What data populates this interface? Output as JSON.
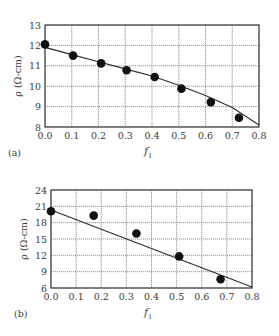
{
  "chart_data": [
    {
      "type": "scatter",
      "panel_label": "(a)",
      "title": "",
      "xlabel": "f",
      "xlabel_sub": "1",
      "ylabel": "ρ (Ω-cm)",
      "xlim": [
        0.0,
        0.8
      ],
      "ylim": [
        8,
        13
      ],
      "x_ticks": [
        "0.0",
        "0.1",
        "0.2",
        "0.3",
        "0.4",
        "0.5",
        "0.6",
        "0.7",
        "0.8"
      ],
      "y_ticks": [
        "8",
        "9",
        "10",
        "11",
        "12",
        "13"
      ],
      "grid": true,
      "legend": null,
      "frame": {
        "left": 45,
        "top": 25,
        "right": 259,
        "bottom": 127
      },
      "series": [
        {
          "name": "measured",
          "kind": "markers",
          "x": [
            0.0,
            0.105,
            0.21,
            0.305,
            0.41,
            0.51,
            0.62,
            0.725
          ],
          "y": [
            12.05,
            11.5,
            11.12,
            10.78,
            10.45,
            9.88,
            9.22,
            8.45
          ]
        },
        {
          "name": "fit",
          "kind": "line",
          "x": [
            0.0,
            0.1,
            0.2,
            0.3,
            0.4,
            0.5,
            0.6,
            0.7,
            0.8
          ],
          "y": [
            11.9,
            11.55,
            11.2,
            10.85,
            10.5,
            10.05,
            9.55,
            8.95,
            8.1
          ]
        }
      ]
    },
    {
      "type": "scatter",
      "panel_label": "(b)",
      "title": "",
      "xlabel": "f",
      "xlabel_sub": "1",
      "ylabel": "ρ (Ω-cm)",
      "xlim": [
        0.0,
        0.8
      ],
      "ylim": [
        6,
        24
      ],
      "x_ticks": [
        "0.0",
        "0.1",
        "0.2",
        "0.3",
        "0.4",
        "0.5",
        "0.6",
        "0.7",
        "0.8"
      ],
      "y_ticks": [
        "6",
        "9",
        "12",
        "15",
        "18",
        "21",
        "24"
      ],
      "grid": true,
      "legend": null,
      "frame": {
        "left": 51,
        "top": 190,
        "right": 252,
        "bottom": 288
      },
      "series": [
        {
          "name": "measured",
          "kind": "markers",
          "x": [
            0.0,
            0.17,
            0.34,
            0.51,
            0.675
          ],
          "y": [
            20.1,
            19.3,
            16.0,
            11.8,
            7.6
          ]
        },
        {
          "name": "fit",
          "kind": "line",
          "x": [
            0.0,
            0.8
          ],
          "y": [
            20.3,
            6.2
          ]
        }
      ]
    }
  ],
  "style": {
    "frame_color": "#2b2b2b",
    "grid_color": "#6a6a6a",
    "marker_color": "#111111",
    "line_color": "#2b2b2b",
    "text_color": "#3a3a3a"
  }
}
